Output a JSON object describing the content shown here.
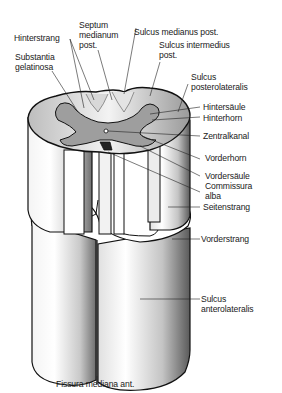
{
  "figure": {
    "colors": {
      "outline": "#111111",
      "grey_matter": "#9a9a9a",
      "white_matter": "#ffffff",
      "stipple": "#555555",
      "label": "#1a1a1a"
    }
  },
  "labels": {
    "hinterstrang": "Hinterstrang",
    "septum_medianum_post": "Septum\nmedianum\npost.",
    "sulcus_medianus_post": "Sulcus medianus post.",
    "sulcus_intermedius_post": "Sulcus intermedius\npost.",
    "substantia_gelatinosa": "Substantia\ngelatinosa",
    "sulcus_posterolateralis": "Sulcus\nposterolateralis",
    "hintersaeule": "Hintersäule",
    "hinterhorn": "Hinterhorn",
    "zentralkanal": "Zentralkanal",
    "vorderhorn": "Vorderhorn",
    "vordersaeule": "Vordersäule",
    "commissura_alba": "Commissura\nalba",
    "seitenstrang": "Seitenstrang",
    "vorderstrang": "Vorderstrang",
    "sulcus_anterolateralis": "Sulcus\nanterolateralis",
    "fissura_mediana_ant": "Fissura mediana ant."
  }
}
